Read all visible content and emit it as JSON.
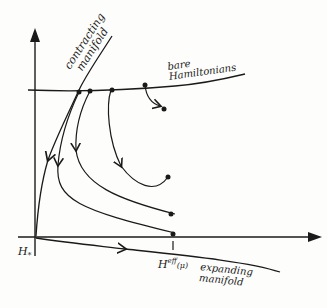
{
  "diagram": {
    "labels": {
      "contracting_line1": "contracting",
      "contracting_line2": "manifold",
      "bare_line1": "bare",
      "bare_line2": "Hamiltonians",
      "h_star": "H",
      "h_star_sub": "*",
      "h_eff": "H",
      "h_eff_sup": "eff",
      "h_eff_arg": "(μ)",
      "expanding_line1": "expanding",
      "expanding_line2": "manifold"
    },
    "colors": {
      "ink": "#1a1a1a",
      "paper": "#fdfdfb"
    }
  }
}
